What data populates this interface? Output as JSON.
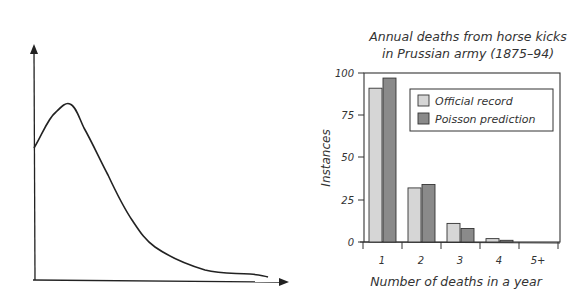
{
  "chart_data": [
    {
      "type": "line",
      "title": "",
      "description": "Hand-sketched skewed distribution curve (no labels)",
      "xlabel": "",
      "ylabel": "",
      "x": [
        0,
        1,
        2,
        3,
        4,
        5,
        6,
        7,
        8,
        9,
        10
      ],
      "values": [
        0.55,
        0.83,
        0.62,
        0.42,
        0.26,
        0.15,
        0.09,
        0.06,
        0.03,
        0.02,
        0.01
      ],
      "grid": false
    },
    {
      "type": "bar",
      "title": "Annual deaths from horse kicks in Prussian army (1875–94)",
      "title_lines": [
        "Annual deaths from horse kicks",
        "in Prussian army (1875–94)"
      ],
      "xlabel": "Number of deaths in a year",
      "ylabel": "Instances",
      "categories": [
        "1",
        "2",
        "3",
        "4",
        "5+"
      ],
      "series": [
        {
          "name": "Official record",
          "color": "#d6d6d6",
          "values": [
            91,
            32,
            11,
            2,
            0
          ]
        },
        {
          "name": "Poisson prediction",
          "color": "#8a8a8a",
          "values": [
            97,
            34,
            8,
            1,
            0
          ]
        }
      ],
      "yticks": [
        0,
        25,
        50,
        75,
        100
      ],
      "ylim": [
        0,
        100
      ],
      "legend_position": "upper right",
      "grid": false
    }
  ]
}
